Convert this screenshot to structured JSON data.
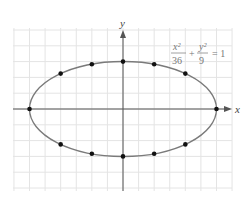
{
  "figure": {
    "type": "ellipse-graph",
    "equation": {
      "x_num": "x²",
      "x_den": "36",
      "plus": "+",
      "y_num": "y²",
      "y_den": "9",
      "equals": "= 1",
      "text": "x^2/36 + y^2/9 = 1"
    },
    "axes": {
      "x_label": "x",
      "y_label": "y"
    },
    "semi_major_a": 6,
    "semi_minor_b": 3,
    "grid": {
      "x_range": [
        -7,
        7
      ],
      "y_range": [
        -5.2,
        5.2
      ],
      "step": 1
    },
    "colors": {
      "curve": "#777777",
      "axis": "#555555",
      "grid": "#e2e2e2",
      "point": "#111111"
    }
  },
  "chart_data": {
    "type": "scatter",
    "xlabel": "x",
    "ylabel": "y",
    "grid": true,
    "curve": "ellipse a=6, b=3 centered at origin",
    "points": [
      {
        "x": -6,
        "y": 0
      },
      {
        "x": -4,
        "y": 2.24
      },
      {
        "x": -2,
        "y": 2.83
      },
      {
        "x": 0,
        "y": 3
      },
      {
        "x": 2,
        "y": 2.83
      },
      {
        "x": 4,
        "y": 2.24
      },
      {
        "x": 6,
        "y": 0
      },
      {
        "x": 4,
        "y": -2.24
      },
      {
        "x": 2,
        "y": -2.83
      },
      {
        "x": 0,
        "y": -3
      },
      {
        "x": -2,
        "y": -2.83
      },
      {
        "x": -4,
        "y": -2.24
      }
    ]
  }
}
